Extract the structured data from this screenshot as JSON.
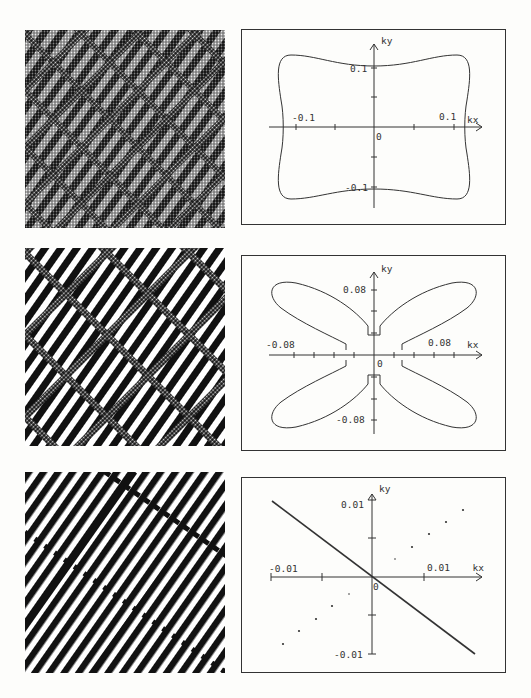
{
  "figures": [
    {
      "texture": {
        "name": "texture-pattern-1",
        "density": "fine mottled cross-hatch",
        "stripe_angle_deg": -55
      },
      "plot": {
        "xlabel": "kx",
        "ylabel": "ky",
        "x_tick_labels": {
          "neg": "-0.1",
          "pos": "0.1"
        },
        "y_tick_labels": {
          "pos": "0.1",
          "neg": "-0.1"
        },
        "origin_label": "0",
        "shape": "rounded square with concave sides"
      }
    },
    {
      "texture": {
        "name": "texture-pattern-2",
        "density": "diagonal stripes with cross-hatched domains",
        "stripe_angle_deg": -55
      },
      "plot": {
        "xlabel": "kx",
        "ylabel": "ky",
        "x_tick_labels": {
          "neg": "-0.08",
          "pos": "0.08"
        },
        "y_tick_labels": {
          "pos": "0.08",
          "neg": "-0.08"
        },
        "origin_label": "0",
        "shape": "four-lobed butterfly"
      }
    },
    {
      "texture": {
        "name": "texture-pattern-3",
        "density": "clean diagonal stripes with grain boundaries",
        "stripe_angle_deg": -55
      },
      "plot": {
        "xlabel": "kx",
        "ylabel": "ky",
        "x_tick_labels": {
          "neg": "-0.01",
          "pos": "0.01"
        },
        "y_tick_labels": {
          "pos": "0.01",
          "neg": "-0.01"
        },
        "origin_label": "0",
        "shape": "straight line through origin with sparse dots"
      }
    }
  ]
}
